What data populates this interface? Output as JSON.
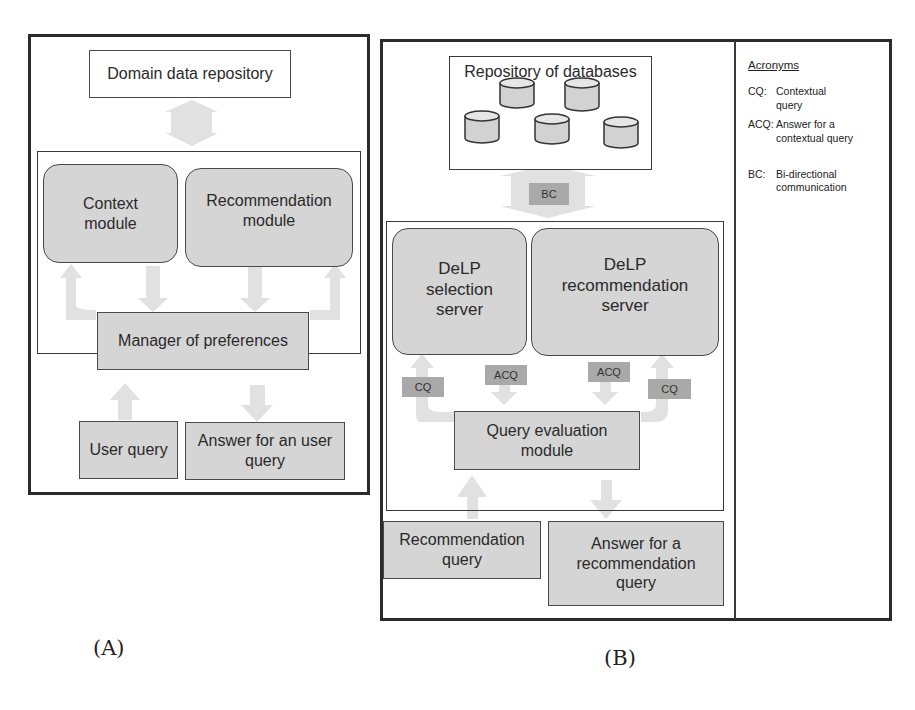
{
  "panel_a": {
    "caption": "(A)",
    "domain_repository": "Domain data repository",
    "context_module": "Context module",
    "recommendation_module": "Recommendation module",
    "manager": "Manager of preferences",
    "user_query": "User query",
    "answer": "Answer for an user query"
  },
  "panel_b": {
    "caption": "(B)",
    "repository": "Repository of databases",
    "database_count": 5,
    "bc_label": "BC",
    "selection_server": "DeLP selection server",
    "recommendation_server": "DeLP recommendation server",
    "cq_label": "CQ",
    "acq_label": "ACQ",
    "query_evaluation": "Query evaluation module",
    "recommendation_query": "Recommendation query",
    "answer": "Answer for a recommendation query"
  },
  "acronyms": {
    "title": "Acronyms",
    "items": [
      {
        "abbr": "CQ:",
        "meaning": "Contextual query"
      },
      {
        "abbr": "ACQ:",
        "meaning": "Answer for a contextual query"
      },
      {
        "abbr": "BC:",
        "meaning": "Bi-directional communication"
      }
    ]
  },
  "colors": {
    "box_fill": "#d5d5d5",
    "arrow_fill": "#e0e0e0",
    "label_fill": "#a9a9a9"
  }
}
